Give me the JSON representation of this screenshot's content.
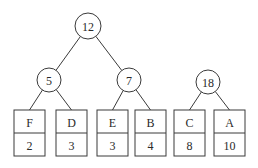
{
  "diagram": {
    "type": "huffman-forest",
    "colors": {
      "stroke": "#3a3a3a",
      "text": "#2a2a2a",
      "background": "#ffffff"
    },
    "internal_nodes": [
      {
        "id": "n12",
        "weight": "12",
        "cx": 88,
        "cy": 26,
        "r": 13
      },
      {
        "id": "n5",
        "weight": "5",
        "cx": 49,
        "cy": 80,
        "r": 12
      },
      {
        "id": "n7",
        "weight": "7",
        "cx": 129,
        "cy": 80,
        "r": 12
      },
      {
        "id": "n18",
        "weight": "18",
        "cx": 208,
        "cy": 82,
        "r": 12
      }
    ],
    "leaves": [
      {
        "id": "F",
        "symbol": "F",
        "weight": "2",
        "x": 14,
        "parent": "n5"
      },
      {
        "id": "D",
        "symbol": "D",
        "weight": "3",
        "x": 56,
        "parent": "n5"
      },
      {
        "id": "E",
        "symbol": "E",
        "weight": "3",
        "x": 97,
        "parent": "n7"
      },
      {
        "id": "B",
        "symbol": "B",
        "weight": "4",
        "x": 135,
        "parent": "n7"
      },
      {
        "id": "C",
        "symbol": "C",
        "weight": "8",
        "x": 174,
        "parent": "n18"
      },
      {
        "id": "A",
        "symbol": "A",
        "weight": "10",
        "x": 214,
        "parent": "n18"
      }
    ],
    "edges": [
      {
        "from": "n12",
        "to": "n5"
      },
      {
        "from": "n12",
        "to": "n7"
      }
    ]
  }
}
